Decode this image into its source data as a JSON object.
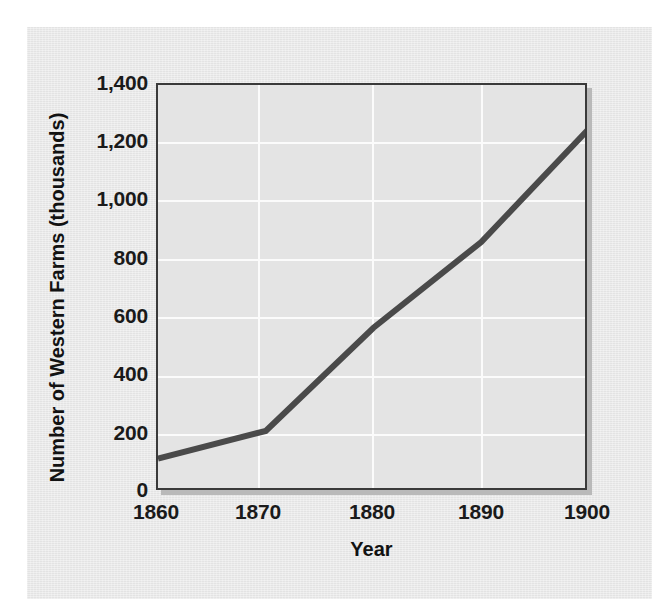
{
  "chart_data": {
    "type": "line",
    "title": "",
    "xlabel": "Year",
    "ylabel": "Number of Western Farms (thousands)",
    "x": [
      1860,
      1870,
      1880,
      1890,
      1900
    ],
    "values": [
      115,
      210,
      565,
      860,
      1250
    ],
    "series": [
      {
        "name": "Number of Western Farms (thousands)",
        "values": [
          115,
          210,
          565,
          860,
          1250
        ]
      }
    ],
    "categories": [
      "1860",
      "1870",
      "1880",
      "1890",
      "1900"
    ],
    "xlim": [
      1860,
      1900
    ],
    "ylim": [
      0,
      1400
    ],
    "ytick_values": [
      0,
      200,
      400,
      600,
      800,
      1000,
      1200,
      1400
    ],
    "ytick_labels": [
      "0",
      "200",
      "400",
      "600",
      "800",
      "1,000",
      "1,200",
      "1,400"
    ],
    "xtick_labels": [
      "1860",
      "1870",
      "1880",
      "1890",
      "1900"
    ],
    "grid": true,
    "legend": "none",
    "line_color": "#4a4a4a",
    "plot_background": "#e4e4e4",
    "figure_background": "#e9e9e9",
    "gridline_color": "#fbfbfb",
    "axis_color": "#3a3a3a"
  },
  "axes": {
    "y_title": "Number of Western Farms (thousands)",
    "x_title": "Year",
    "y_ticks": [
      {
        "label": "1,400",
        "value": 1400
      },
      {
        "label": "1,200",
        "value": 1200
      },
      {
        "label": "1,000",
        "value": 1000
      },
      {
        "label": "800",
        "value": 800
      },
      {
        "label": "600",
        "value": 600
      },
      {
        "label": "400",
        "value": 400
      },
      {
        "label": "200",
        "value": 200
      },
      {
        "label": "0",
        "value": 0
      }
    ],
    "x_ticks": [
      {
        "label": "1860",
        "value": 1860
      },
      {
        "label": "1870",
        "value": 1870
      },
      {
        "label": "1880",
        "value": 1880
      },
      {
        "label": "1890",
        "value": 1890
      },
      {
        "label": "1900",
        "value": 1900
      }
    ]
  }
}
